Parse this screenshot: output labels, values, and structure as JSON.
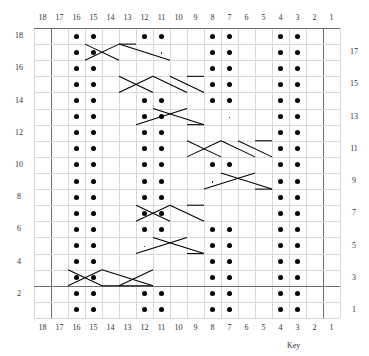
{
  "chart_data": {
    "type": "table",
    "title": "",
    "columns": 18,
    "rows": 18,
    "xlabel": "",
    "ylabel": "",
    "grid": true,
    "column_labels_top": [
      "18",
      "17",
      "16",
      "15",
      "14",
      "13",
      "12",
      "11",
      "10",
      "9",
      "8",
      "7",
      "6",
      "5",
      "4",
      "3",
      "2",
      "1"
    ],
    "column_labels_bottom": [
      "18",
      "17",
      "16",
      "15",
      "14",
      "13",
      "12",
      "11",
      "10",
      "9",
      "8",
      "7",
      "6",
      "5",
      "4",
      "3",
      "2",
      "1"
    ],
    "row_labels_left": [
      "18",
      "16",
      "14",
      "12",
      "10",
      "8",
      "6",
      "4",
      "2"
    ],
    "row_labels_right": [
      "17",
      "15",
      "13",
      "11",
      "9",
      "7",
      "5",
      "3",
      "1"
    ],
    "legend": "Key",
    "symbols": {
      "purl_dot": "large filled dot = purl stitch",
      "small_dot": "small dot = single marker stitch",
      "cable_cross": "diagonal lines = cable crossing / travelling stitch"
    },
    "purl_dots": [
      {
        "row": 18,
        "cols": [
          16,
          15,
          12,
          11,
          8,
          7,
          4,
          3
        ]
      },
      {
        "row": 17,
        "cols": [
          16,
          15,
          8,
          7,
          4,
          3
        ]
      },
      {
        "row": 16,
        "cols": [
          16,
          15,
          8,
          7,
          4,
          3
        ]
      },
      {
        "row": 15,
        "cols": [
          16,
          15,
          8,
          7,
          4,
          3
        ]
      },
      {
        "row": 14,
        "cols": [
          16,
          15,
          12,
          11,
          8,
          7,
          4,
          3
        ]
      },
      {
        "row": 13,
        "cols": [
          16,
          15,
          12,
          11,
          4,
          3
        ]
      },
      {
        "row": 12,
        "cols": [
          16,
          15,
          12,
          11,
          4,
          3
        ]
      },
      {
        "row": 11,
        "cols": [
          16,
          15,
          12,
          11,
          4,
          3
        ]
      },
      {
        "row": 10,
        "cols": [
          16,
          15,
          12,
          11,
          8,
          7,
          4,
          3
        ]
      },
      {
        "row": 9,
        "cols": [
          16,
          15,
          12,
          11,
          4,
          3
        ]
      },
      {
        "row": 8,
        "cols": [
          16,
          15,
          12,
          11,
          4,
          3
        ]
      },
      {
        "row": 7,
        "cols": [
          16,
          15,
          12,
          11,
          4,
          3
        ]
      },
      {
        "row": 6,
        "cols": [
          16,
          15,
          12,
          11,
          8,
          7,
          4,
          3
        ]
      },
      {
        "row": 5,
        "cols": [
          16,
          15,
          8,
          7,
          4,
          3
        ]
      },
      {
        "row": 4,
        "cols": [
          16,
          15,
          8,
          7,
          4,
          3
        ]
      },
      {
        "row": 3,
        "cols": [
          16,
          15,
          8,
          7,
          4,
          3
        ]
      },
      {
        "row": 2,
        "cols": [
          16,
          15,
          12,
          11,
          8,
          7,
          4,
          3
        ]
      },
      {
        "row": 1,
        "cols": [
          16,
          15,
          12,
          11,
          8,
          7,
          4,
          3
        ]
      }
    ],
    "small_dots": [
      {
        "row": 17,
        "col": 11
      },
      {
        "row": 13,
        "col": 7
      },
      {
        "row": 9,
        "col": 8
      },
      {
        "row": 5,
        "col": 12
      }
    ],
    "heavy_borders": {
      "left_column_edge": 17,
      "right_column_edge": 2,
      "top_row_edge": 18,
      "bottom_heavy_row": 3,
      "note": "Heavy vertical rules bound the repeat between stitch 17 and stitch 2; heavy horizontal rules mark the top of row 18 and the base of row 3."
    }
  },
  "legend_label": "Key"
}
